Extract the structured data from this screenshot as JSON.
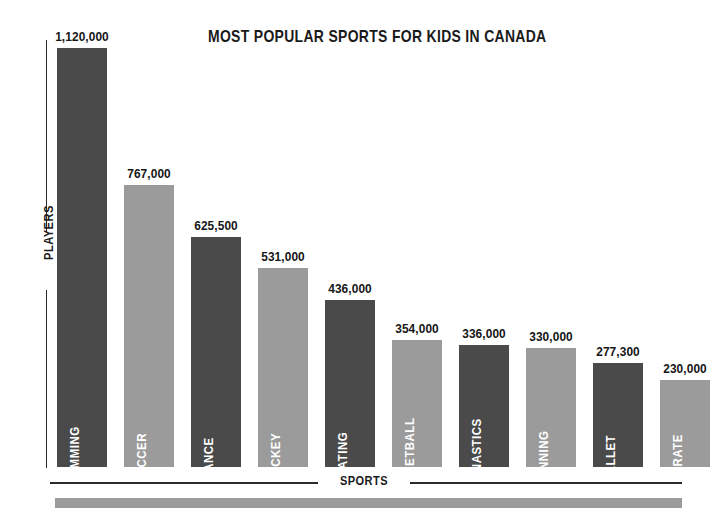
{
  "chart_data": {
    "type": "bar",
    "title": "MOST POPULAR SPORTS FOR KIDS IN CANADA",
    "xlabel": "SPORTS",
    "ylabel": "PLAYERS",
    "grid": false,
    "legend": "none",
    "ylim": [
      0,
      1120000
    ],
    "categories": [
      "SWIMMING",
      "SOCCER",
      "DANCE",
      "HOCKEY",
      "SKATING",
      "BASKETBALL",
      "GYMNASTICS",
      "RUNNING",
      "BALLET",
      "KARATE"
    ],
    "values": [
      1120000,
      767000,
      625500,
      531000,
      436000,
      354000,
      336000,
      330000,
      277300,
      230000
    ],
    "value_labels": [
      "1,120,000",
      "767,000",
      "625,500",
      "531,000",
      "436,000",
      "354,000",
      "336,000",
      "330,000",
      "277,300",
      "230,000"
    ],
    "bar_colors": [
      "#4a4a4a",
      "#9b9b9b",
      "#4a4a4a",
      "#9b9b9b",
      "#4a4a4a",
      "#9b9b9b",
      "#4a4a4a",
      "#9b9b9b",
      "#4a4a4a",
      "#9b9b9b"
    ],
    "bars": [
      {
        "category": "SWIMMING",
        "value": 1120000,
        "value_label": "1,120,000",
        "color": "#4a4a4a",
        "left": 0,
        "height": 419
      },
      {
        "category": "SOCCER",
        "value": 767000,
        "value_label": "767,000",
        "color": "#9b9b9b",
        "left": 67,
        "height": 282
      },
      {
        "category": "DANCE",
        "value": 625500,
        "value_label": "625,500",
        "color": "#4a4a4a",
        "left": 134,
        "height": 230
      },
      {
        "category": "HOCKEY",
        "value": 531000,
        "value_label": "531,000",
        "color": "#9b9b9b",
        "left": 201,
        "height": 199
      },
      {
        "category": "SKATING",
        "value": 436000,
        "value_label": "436,000",
        "color": "#4a4a4a",
        "left": 268,
        "height": 167
      },
      {
        "category": "BASKETBALL",
        "value": 354000,
        "value_label": "354,000",
        "color": "#9b9b9b",
        "left": 335,
        "height": 127
      },
      {
        "category": "GYMNASTICS",
        "value": 336000,
        "value_label": "336,000",
        "color": "#4a4a4a",
        "left": 402,
        "height": 122
      },
      {
        "category": "RUNNING",
        "value": 330000,
        "value_label": "330,000",
        "color": "#9b9b9b",
        "left": 469,
        "height": 119
      },
      {
        "category": "BALLET",
        "value": 277300,
        "value_label": "277,300",
        "color": "#4a4a4a",
        "left": 536,
        "height": 104
      },
      {
        "category": "KARATE",
        "value": 230000,
        "value_label": "230,000",
        "color": "#9b9b9b",
        "left": 603,
        "height": 87
      }
    ],
    "colors": {
      "dark_bar": "#4a4a4a",
      "light_bar": "#9b9b9b",
      "axis": "#2b2b2b",
      "text": "#1a1a1a",
      "bar_label_text": "#ffffff",
      "background": "#ffffff",
      "footer_band": "#9b9b9b"
    }
  }
}
